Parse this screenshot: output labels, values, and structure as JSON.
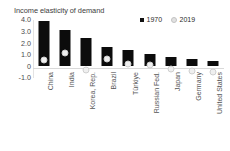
{
  "chart_data": {
    "type": "bar",
    "title": "Income elasticity of demand",
    "xlabel": "",
    "ylabel": "",
    "ylim": [
      -1.0,
      4.0
    ],
    "yticks": [
      "4.0",
      "3.0",
      "2.0",
      "1.0",
      "0",
      "-1.0"
    ],
    "ytick_values": [
      4.0,
      3.0,
      2.0,
      1.0,
      0.0,
      -1.0
    ],
    "grid": false,
    "legend_position": "top-right",
    "categories": [
      "China",
      "India",
      "Korea, Rep.",
      "Brazil",
      "Türkiye",
      "Russian Fed.",
      "Japan",
      "Germany",
      "United States"
    ],
    "series": [
      {
        "name": "1970",
        "type": "bar",
        "color": "#0c0c0c",
        "values": [
          3.9,
          3.1,
          2.45,
          1.65,
          1.45,
          1.1,
          0.85,
          0.6,
          0.45
        ]
      },
      {
        "name": "2019",
        "type": "marker",
        "color": "#efefef",
        "values": [
          0.9,
          1.55,
          0.1,
          1.0,
          0.6,
          0.55,
          0.15,
          0.02,
          -0.12
        ]
      }
    ]
  },
  "legend": {
    "entries": [
      {
        "label": "1970",
        "swatch": "black-square"
      },
      {
        "label": "2019",
        "swatch": "light-circle"
      }
    ]
  }
}
